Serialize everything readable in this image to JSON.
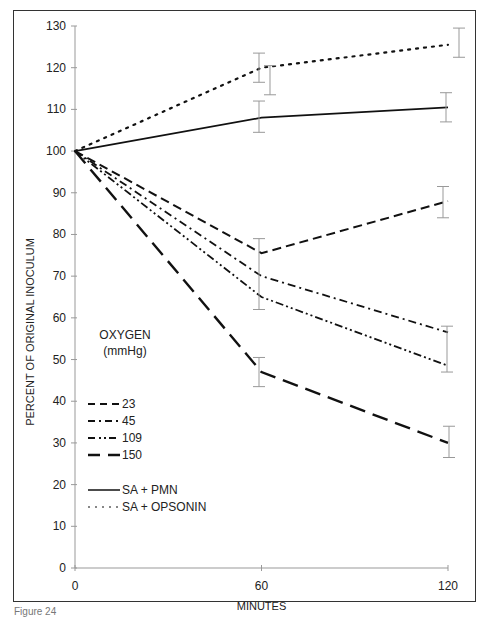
{
  "chart_data": {
    "type": "line",
    "title": "",
    "xlabel": "MINUTES",
    "ylabel": "PERCENT OF ORIGINAL INOCULUM",
    "x": [
      0,
      60,
      120
    ],
    "xticks": [
      "0",
      "60",
      "120"
    ],
    "yticks": [
      "0",
      "10",
      "20",
      "30",
      "40",
      "50",
      "60",
      "70",
      "80",
      "90",
      "100",
      "110",
      "120",
      "130"
    ],
    "xlim": [
      0,
      120
    ],
    "ylim": [
      0,
      130
    ],
    "grid": false,
    "legend_title": "OXYGEN (mmHg)",
    "legend_position": "lower-left",
    "series": [
      {
        "name": "23",
        "style": "dashed",
        "values": [
          100,
          75.5,
          88
        ],
        "error": [
          null,
          3.5,
          3.5
        ]
      },
      {
        "name": "45",
        "style": "dash-dot",
        "values": [
          100,
          70,
          56.5
        ],
        "error": [
          null,
          null,
          null
        ]
      },
      {
        "name": "109",
        "style": "dash-dot-dot",
        "values": [
          100,
          65,
          48.5
        ],
        "error": [
          null,
          3,
          5.5
        ]
      },
      {
        "name": "150",
        "style": "long-dash-thick",
        "values": [
          100,
          47,
          30
        ],
        "error": [
          null,
          3.5,
          3.5
        ]
      },
      {
        "name": "SA + PMN",
        "style": "solid",
        "values": [
          100,
          108,
          110.5
        ],
        "error": [
          null,
          3.5,
          3.5
        ]
      },
      {
        "name": "SA + OPSONIN",
        "style": "dotted",
        "values": [
          100,
          120,
          125.5
        ],
        "error": [
          null,
          3.5,
          3.5
        ]
      }
    ]
  },
  "axes": {
    "xlabel": "MINUTES",
    "ylabel": "PERCENT OF ORIGINAL INOCULUM"
  },
  "legend": {
    "title_line1": "OXYGEN",
    "title_line2": "(mmHg)",
    "items": [
      "23",
      "45",
      "109",
      "150",
      "SA + PMN",
      "SA + OPSONIN"
    ]
  },
  "caption": "Figure 24"
}
